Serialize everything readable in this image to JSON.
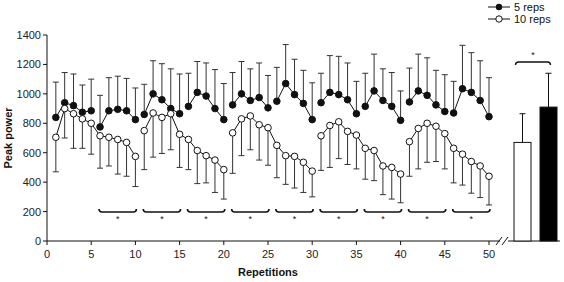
{
  "chart_data": {
    "type": "line",
    "title": "",
    "xlabel": "Repetitions",
    "ylabel": "Peak power",
    "xlim": [
      0,
      50
    ],
    "ylim": [
      0,
      1400
    ],
    "x_ticks": [
      0,
      5,
      10,
      15,
      20,
      25,
      30,
      35,
      40,
      45,
      50
    ],
    "y_ticks": [
      0,
      200,
      400,
      600,
      800,
      1000,
      1200,
      1400
    ],
    "grid": false,
    "legend_position": "top-right",
    "legend": [
      "5 reps",
      "10 reps"
    ],
    "series": [
      {
        "name": "5 reps",
        "marker": "filled-circle",
        "error_direction": "up",
        "blocks": [
          [
            1,
            5
          ],
          [
            6,
            10
          ],
          [
            11,
            15
          ],
          [
            16,
            20
          ],
          [
            21,
            25
          ],
          [
            26,
            30
          ],
          [
            31,
            35
          ],
          [
            36,
            40
          ],
          [
            41,
            45
          ],
          [
            46,
            50
          ]
        ],
        "x": [
          1,
          2,
          3,
          4,
          5,
          6,
          7,
          8,
          9,
          10,
          11,
          12,
          13,
          14,
          15,
          16,
          17,
          18,
          19,
          20,
          21,
          22,
          23,
          24,
          25,
          26,
          27,
          28,
          29,
          30,
          31,
          32,
          33,
          34,
          35,
          36,
          37,
          38,
          39,
          40,
          41,
          42,
          43,
          44,
          45,
          46,
          47,
          48,
          49,
          50
        ],
        "values": [
          840,
          940,
          920,
          875,
          885,
          775,
          885,
          895,
          885,
          825,
          860,
          1000,
          960,
          900,
          865,
          915,
          1010,
          985,
          900,
          825,
          925,
          1000,
          955,
          975,
          905,
          950,
          1070,
          995,
          935,
          825,
          940,
          1010,
          995,
          960,
          865,
          915,
          1020,
          955,
          915,
          820,
          945,
          1020,
          990,
          925,
          880,
          870,
          1035,
          1010,
          955,
          845
        ],
        "error": [
          240,
          205,
          215,
          185,
          215,
          215,
          225,
          225,
          220,
          215,
          205,
          225,
          245,
          270,
          270,
          225,
          210,
          225,
          265,
          245,
          220,
          220,
          215,
          235,
          220,
          230,
          265,
          240,
          225,
          250,
          200,
          250,
          260,
          250,
          220,
          225,
          250,
          215,
          230,
          200,
          230,
          250,
          255,
          235,
          250,
          215,
          295,
          270,
          270,
          265
        ]
      },
      {
        "name": "10 reps",
        "marker": "open-circle",
        "error_direction": "down",
        "blocks": [
          [
            1,
            10
          ],
          [
            11,
            20
          ],
          [
            21,
            30
          ],
          [
            31,
            40
          ],
          [
            41,
            50
          ]
        ],
        "x": [
          1,
          2,
          3,
          4,
          5,
          6,
          7,
          8,
          9,
          10,
          11,
          12,
          13,
          14,
          15,
          16,
          17,
          18,
          19,
          20,
          21,
          22,
          23,
          24,
          25,
          26,
          27,
          28,
          29,
          30,
          31,
          32,
          33,
          34,
          35,
          36,
          37,
          38,
          39,
          40,
          41,
          42,
          43,
          44,
          45,
          46,
          47,
          48,
          49,
          50
        ],
        "values": [
          705,
          900,
          865,
          830,
          800,
          715,
          705,
          690,
          670,
          575,
          750,
          870,
          840,
          865,
          725,
          690,
          615,
          580,
          550,
          485,
          735,
          830,
          850,
          790,
          770,
          650,
          580,
          575,
          535,
          475,
          715,
          785,
          810,
          745,
          720,
          630,
          615,
          510,
          500,
          455,
          675,
          765,
          800,
          780,
          730,
          630,
          590,
          540,
          510,
          440
        ],
        "error": [
          235,
          200,
          235,
          200,
          210,
          220,
          195,
          235,
          230,
          205,
          265,
          300,
          245,
          245,
          225,
          205,
          225,
          185,
          220,
          200,
          275,
          250,
          230,
          240,
          255,
          220,
          195,
          215,
          205,
          175,
          235,
          285,
          250,
          225,
          230,
          210,
          205,
          195,
          215,
          195,
          235,
          275,
          265,
          240,
          240,
          235,
          210,
          215,
          215,
          195
        ]
      }
    ],
    "significance_brackets": [
      {
        "from": 6,
        "to": 10,
        "label": "*"
      },
      {
        "from": 11,
        "to": 15,
        "label": "*"
      },
      {
        "from": 16,
        "to": 20,
        "label": "*"
      },
      {
        "from": 21,
        "to": 25,
        "label": "*"
      },
      {
        "from": 26,
        "to": 30,
        "label": "*"
      },
      {
        "from": 31,
        "to": 35,
        "label": "*"
      },
      {
        "from": 36,
        "to": 40,
        "label": "*"
      },
      {
        "from": 41,
        "to": 45,
        "label": "*"
      },
      {
        "from": 46,
        "to": 50,
        "label": "*"
      }
    ],
    "summary_bars": {
      "categories": [
        "10 reps",
        "5 reps"
      ],
      "values": [
        670,
        910
      ],
      "error": [
        195,
        230
      ],
      "fills": [
        "#ffffff",
        "#000000"
      ],
      "significance": "*"
    }
  },
  "labels": {
    "xlabel": "Repetitions",
    "ylabel": "Peak power",
    "legend_5": "5 reps",
    "legend_10": "10 reps",
    "star": "*"
  }
}
